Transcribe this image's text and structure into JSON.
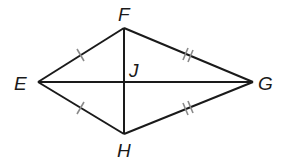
{
  "diagram": {
    "type": "kite",
    "colors": {
      "line": "#1a1a1a",
      "tick": "#8a8a8a",
      "background": "#ffffff"
    },
    "vertices": {
      "E": {
        "label": "E",
        "x": 38,
        "y": 82
      },
      "F": {
        "label": "F",
        "x": 124,
        "y": 28
      },
      "G": {
        "label": "G",
        "x": 253,
        "y": 82
      },
      "H": {
        "label": "H",
        "x": 124,
        "y": 134
      }
    },
    "intersection": {
      "label": "J",
      "x": 124,
      "y": 82
    },
    "segments": [
      "EF",
      "FG",
      "GH",
      "HE",
      "EG",
      "FH"
    ],
    "congruence_marks": [
      {
        "segment": "EF",
        "ticks": 1
      },
      {
        "segment": "EH",
        "ticks": 1
      },
      {
        "segment": "FG",
        "ticks": 2
      },
      {
        "segment": "HG",
        "ticks": 2
      }
    ]
  }
}
